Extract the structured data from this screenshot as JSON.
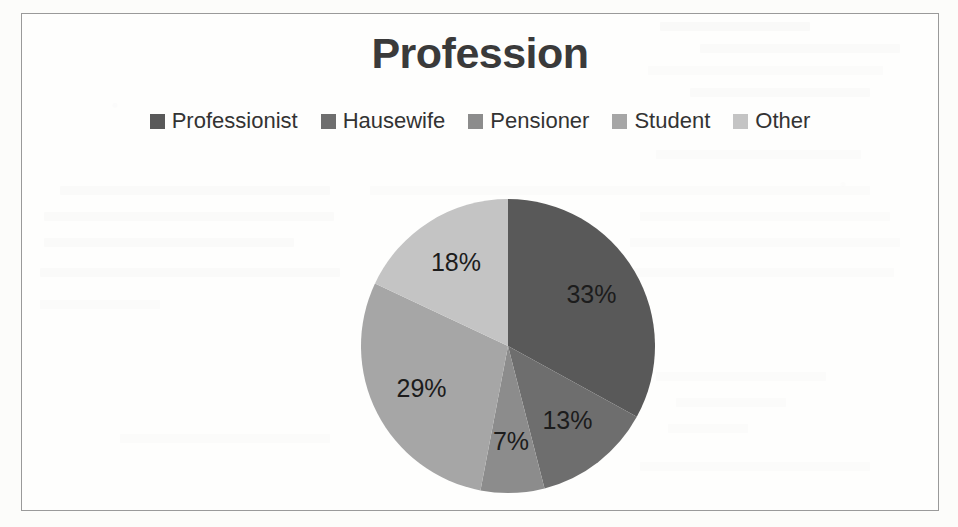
{
  "chart_data": {
    "type": "pie",
    "title": "Profession",
    "categories": [
      "Professionist",
      "Hausewife",
      "Pensioner",
      "Student",
      "Other"
    ],
    "values": [
      33,
      13,
      7,
      29,
      18
    ],
    "unit": "%",
    "data_labels": [
      "33%",
      "13%",
      "7%",
      "29%",
      "18%"
    ],
    "colors": [
      "#595959",
      "#6e6e6e",
      "#8c8c8c",
      "#a6a6a6",
      "#c4c4c4"
    ],
    "legend_position": "top",
    "start_angle_deg": 0,
    "direction": "clockwise",
    "grid": false,
    "xlabel": "",
    "ylabel": ""
  },
  "frame": {
    "border_color": "#9a9a9a",
    "background": "#ffffff"
  }
}
